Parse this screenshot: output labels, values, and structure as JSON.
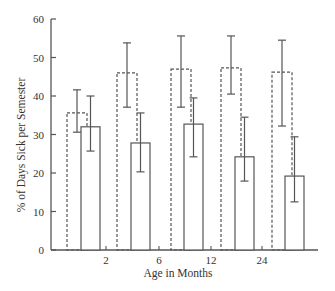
{
  "chart_data": {
    "type": "bar",
    "title": "",
    "xlabel": "Age in Months",
    "ylabel": "% of Days Sick per Semester",
    "ylim": [
      0,
      60
    ],
    "yticks": [
      0,
      10,
      20,
      30,
      40,
      50,
      60
    ],
    "xtick_labels": [
      "2",
      "6",
      "12",
      "24"
    ],
    "grid": false,
    "legend": null,
    "categories": [
      "group 1",
      "group 2",
      "group 3",
      "group 4",
      "group 5"
    ],
    "series": [
      {
        "name": "dashed",
        "style": "dashed",
        "values": [
          35.6,
          46.0,
          47.0,
          47.3,
          46.2
        ],
        "err_high": [
          41.6,
          53.8,
          55.6,
          55.6,
          54.5
        ],
        "err_low": [
          30.6,
          37.1,
          37.1,
          40.5,
          32.2
        ]
      },
      {
        "name": "solid",
        "style": "solid",
        "values": [
          32.0,
          27.8,
          32.7,
          24.2,
          19.2
        ],
        "err_high": [
          40.0,
          35.6,
          39.5,
          34.5,
          29.4
        ],
        "err_low": [
          25.7,
          20.3,
          24.2,
          17.9,
          12.5
        ]
      }
    ]
  },
  "layout": {
    "axis_color": "#555555",
    "bar_stroke": "#555555"
  }
}
